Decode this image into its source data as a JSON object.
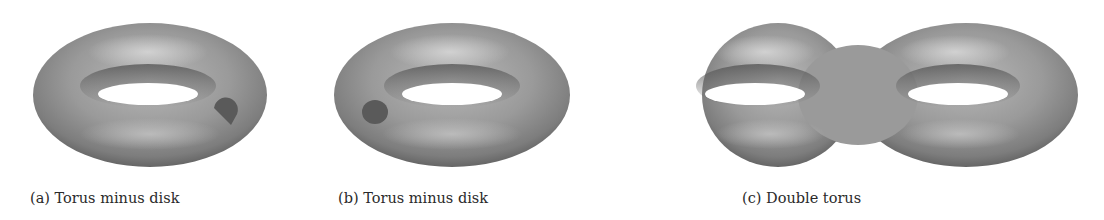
{
  "figures": [
    {
      "id": "a",
      "caption": "(a) Torus minus disk",
      "shape": "torus-with-disk-removed",
      "disk_position": "right-front"
    },
    {
      "id": "b",
      "caption": "(b) Torus minus disk",
      "shape": "torus-with-disk-removed",
      "disk_position": "left-front"
    },
    {
      "id": "c",
      "caption": "(c) Double torus",
      "shape": "double-torus"
    }
  ],
  "colors": {
    "surface_light": "#c8c8c8",
    "surface_mid": "#8f8f8f",
    "surface_dark": "#5e5e5e",
    "disk": "#555555",
    "background": "#ffffff"
  }
}
